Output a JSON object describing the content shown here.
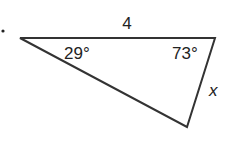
{
  "figure": {
    "type": "triangle",
    "vertices": {
      "left": [
        20,
        38
      ],
      "top_right": [
        215,
        38
      ],
      "bottom": [
        187,
        127
      ]
    },
    "labels": {
      "side_top": "4",
      "angle_left": "29°",
      "angle_right": "73°",
      "side_right": "x"
    },
    "colors": {
      "stroke": "#333333",
      "text": "#222222"
    }
  }
}
